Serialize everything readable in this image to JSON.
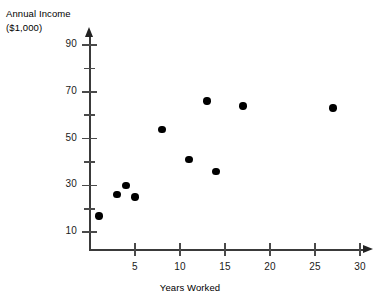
{
  "chart_data": {
    "type": "scatter",
    "title": "",
    "ylabel": "Annual Income ($1,000)",
    "ylabel_lines": [
      "Annual Income",
      "($1,000)"
    ],
    "xlabel": "Years Worked",
    "xlim": [
      0,
      30
    ],
    "ylim": [
      0,
      95
    ],
    "grid": false,
    "legend": null,
    "x_ticks_major": [
      5,
      10,
      15,
      20,
      25,
      30
    ],
    "x_tick_labels": [
      "5",
      "10",
      "15",
      "20",
      "25",
      "30"
    ],
    "y_ticks_major": [
      10,
      30,
      50,
      70,
      90
    ],
    "y_tick_labels": [
      "10",
      "30",
      "50",
      "70",
      "90"
    ],
    "y_ticks_minor": [
      20,
      40,
      60,
      80
    ],
    "marker": "filled-circle",
    "marker_color": "#000000",
    "axis_color": "#3a3a3a",
    "background_color": "#ffffff",
    "points": [
      {
        "x": 1,
        "y": 17
      },
      {
        "x": 3,
        "y": 26
      },
      {
        "x": 4,
        "y": 30
      },
      {
        "x": 5,
        "y": 25
      },
      {
        "x": 8,
        "y": 54
      },
      {
        "x": 11,
        "y": 41
      },
      {
        "x": 13,
        "y": 66
      },
      {
        "x": 14,
        "y": 36
      },
      {
        "x": 17,
        "y": 64
      },
      {
        "x": 27,
        "y": 63
      }
    ]
  }
}
